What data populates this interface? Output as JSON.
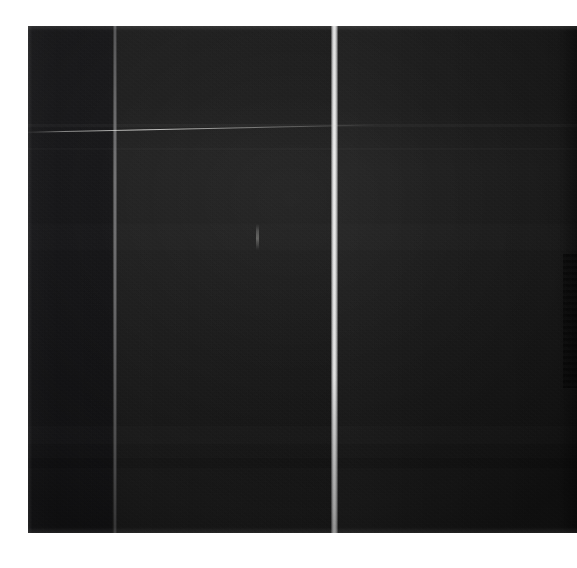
{
  "image": {
    "kind": "photograph",
    "description": "Very dark, underexposed photograph of a three-panel dark surface",
    "width": 577,
    "height": 568,
    "background_color": "#ffffff",
    "plate": {
      "left": 28,
      "top": 26,
      "width": 549,
      "height": 507,
      "base_color": "#1a1a1a"
    }
  },
  "panels": [
    {
      "id": "left",
      "label": "left-panel",
      "x": 0,
      "width": 84,
      "fill_color": "#18181a",
      "tone": "darkest"
    },
    {
      "id": "middle",
      "label": "middle-panel",
      "x": 89,
      "width": 214,
      "fill_color": "#1c1c1c",
      "tone": "mid"
    },
    {
      "id": "right",
      "label": "right-panel",
      "x": 310,
      "width": 239,
      "fill_color": "#1b1b1b",
      "tone": "mid"
    }
  ],
  "seams": [
    {
      "id": "seam-left",
      "label": "dim-gray-vertical-seam",
      "x": 85,
      "width": 4,
      "color": "#8a8a8c",
      "brightness": "dim"
    },
    {
      "id": "seam-right",
      "label": "bright-white-vertical-seam",
      "x": 303,
      "width": 7,
      "color": "#eeeeee",
      "brightness": "bright"
    }
  ],
  "highlights": [
    {
      "id": "streak",
      "label": "thin-diagonal-light-streak",
      "color": "#f5f5f2",
      "angle_deg": -1.25,
      "top": 106
    },
    {
      "id": "glint",
      "label": "small-vertical-glint",
      "color": "#cdcdc8",
      "left": 228,
      "top": 198
    }
  ],
  "bands": [
    {
      "id": "band-a",
      "top": 98,
      "height": 3,
      "color": "#ffffff"
    },
    {
      "id": "band-b",
      "top": 122,
      "height": 2,
      "color": "#ffffff"
    },
    {
      "id": "band-c",
      "top": 198,
      "height": 26,
      "color": "#ffffff"
    },
    {
      "id": "band-d",
      "top": 400,
      "height": 18,
      "color": "#ffffff"
    },
    {
      "id": "band-e",
      "top": 432,
      "height": 10,
      "color": "#000000"
    }
  ],
  "right_edge": {
    "label": "jagged-dark-edge",
    "top": 228,
    "height": 134,
    "color": "#000000"
  },
  "marking": {
    "text": "",
    "color": "#afafac",
    "note": "illegible faint marking at lower-left of plate"
  }
}
